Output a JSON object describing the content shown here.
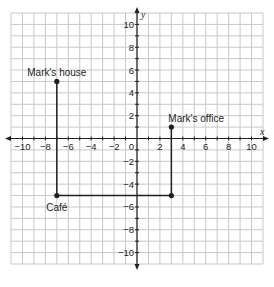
{
  "chart_data": {
    "type": "scatter",
    "title": "",
    "xlabel": "x",
    "ylabel": "y",
    "xlim": [
      -11,
      11
    ],
    "ylim": [
      -11,
      11
    ],
    "grid": true,
    "grid_step": 1,
    "x_ticks": [
      -10,
      -8,
      -6,
      -4,
      -2,
      2,
      4,
      6,
      8,
      10
    ],
    "y_ticks": [
      10,
      8,
      6,
      4,
      2,
      -2,
      -4,
      -6,
      -8,
      -10
    ],
    "origin_label": "0",
    "points": [
      {
        "name": "Mark's house",
        "x": -7,
        "y": 5,
        "label_position": "top"
      },
      {
        "name": "Mark's office",
        "x": 3,
        "y": 1,
        "label_position": "top"
      },
      {
        "name": "Café",
        "x": -7,
        "y": -5,
        "label_position": "bottom"
      },
      {
        "name": "",
        "x": 3,
        "y": -5,
        "label_position": "none"
      }
    ],
    "path": [
      {
        "x": -7,
        "y": 5
      },
      {
        "x": -7,
        "y": -5
      },
      {
        "x": 3,
        "y": -5
      },
      {
        "x": 3,
        "y": 1
      }
    ]
  }
}
